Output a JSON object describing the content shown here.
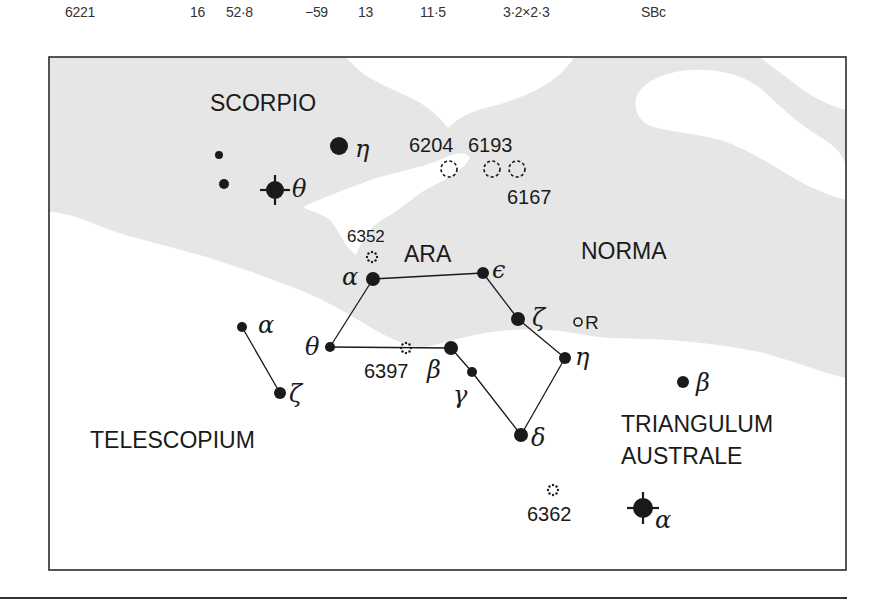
{
  "table_row": {
    "ngc": "6221",
    "ra_h": "16",
    "ra_m": "52·8",
    "dec_d": "−59",
    "dec_m": "13",
    "magnitude": "11·5",
    "size": "3·2×2·3",
    "type": "SBc"
  },
  "map": {
    "constellations": [
      {
        "name": "SCORPIO",
        "x": 210,
        "y": 111,
        "size": 23
      },
      {
        "name": "ARA",
        "x": 404,
        "y": 262,
        "size": 23
      },
      {
        "name": "NORMA",
        "x": 581,
        "y": 259,
        "size": 23
      },
      {
        "name": "TELESCOPIUM",
        "x": 90,
        "y": 448,
        "size": 23
      },
      {
        "name": "TRIANGULUM",
        "x": 621,
        "y": 432,
        "size": 23
      },
      {
        "name": "AUSTRALE",
        "x": 621,
        "y": 464,
        "size": 23
      }
    ],
    "stars": [
      {
        "id": "sco-eta",
        "greek": "η",
        "x": 339,
        "y": 146,
        "r": 9,
        "lx": 355,
        "ly": 157
      },
      {
        "id": "sco-theta",
        "greek": "θ",
        "x": 275,
        "y": 190,
        "r": 9,
        "cross": true,
        "lx": 292,
        "ly": 197
      },
      {
        "id": "sco-a",
        "greek": "",
        "x": 219,
        "y": 155,
        "r": 4
      },
      {
        "id": "sco-b",
        "greek": "",
        "x": 224,
        "y": 184,
        "r": 5
      },
      {
        "id": "ara-alpha",
        "greek": "α",
        "x": 373,
        "y": 279,
        "r": 7,
        "lx": 342,
        "ly": 285
      },
      {
        "id": "ara-epsilon",
        "greek": "ϵ",
        "x": 483,
        "y": 273,
        "r": 6,
        "lx": 492,
        "ly": 278
      },
      {
        "id": "ara-zeta",
        "greek": "ζ",
        "x": 518,
        "y": 319,
        "r": 7,
        "lx": 532,
        "ly": 326
      },
      {
        "id": "ara-eta",
        "greek": "η",
        "x": 565,
        "y": 358,
        "r": 6,
        "lx": 575,
        "ly": 365
      },
      {
        "id": "ara-delta",
        "greek": "δ",
        "x": 521,
        "y": 435,
        "r": 7,
        "lx": 531,
        "ly": 446
      },
      {
        "id": "ara-gamma",
        "greek": "γ",
        "x": 472,
        "y": 372,
        "r": 5,
        "lx": 453,
        "ly": 403
      },
      {
        "id": "ara-beta",
        "greek": "β",
        "x": 451,
        "y": 348,
        "r": 7,
        "lx": 427,
        "ly": 378
      },
      {
        "id": "ara-theta",
        "greek": "θ",
        "x": 330,
        "y": 347,
        "r": 5,
        "lx": 305,
        "ly": 355
      },
      {
        "id": "tel-alpha",
        "greek": "α",
        "x": 242,
        "y": 327,
        "r": 5,
        "lx": 258,
        "ly": 333
      },
      {
        "id": "tel-zeta",
        "greek": "ζ",
        "x": 280,
        "y": 393,
        "r": 6,
        "lx": 289,
        "ly": 402
      },
      {
        "id": "tra-beta",
        "greek": "β",
        "x": 683,
        "y": 382,
        "r": 6,
        "lx": 696,
        "ly": 391
      },
      {
        "id": "tra-alpha",
        "greek": "α",
        "x": 643,
        "y": 508,
        "r": 10,
        "cross": true,
        "lx": 655,
        "ly": 528
      }
    ],
    "lines": [
      [
        "ara-alpha",
        "ara-epsilon"
      ],
      [
        "ara-epsilon",
        "ara-zeta"
      ],
      [
        "ara-zeta",
        "ara-eta"
      ],
      [
        "ara-eta",
        "ara-delta"
      ],
      [
        "ara-delta",
        "ara-gamma"
      ],
      [
        "ara-gamma",
        "ara-beta"
      ],
      [
        "ara-beta",
        "ara-theta"
      ],
      [
        "ara-theta",
        "ara-alpha"
      ],
      [
        "tel-alpha",
        "tel-zeta"
      ]
    ],
    "galaxies": [
      {
        "ngc": "6204",
        "x": 449,
        "y": 169,
        "lx": 409,
        "ly": 152
      },
      {
        "ngc": "6193",
        "x": 492,
        "y": 169,
        "lx": 468,
        "ly": 152
      },
      {
        "ngc": "6167",
        "x": 517,
        "y": 169,
        "lx": 507,
        "ly": 204
      }
    ],
    "clusters": [
      {
        "ngc": "6352",
        "x": 372,
        "y": 257,
        "lx": 347,
        "ly": 242,
        "label_size": 17
      },
      {
        "ngc": "6397",
        "x": 406,
        "y": 348,
        "lx": 364,
        "ly": 378,
        "label_size": 20
      },
      {
        "ngc": "6362",
        "x": 553,
        "y": 490,
        "lx": 527,
        "ly": 521,
        "label_size": 20
      }
    ],
    "variable": {
      "label": "R",
      "x": 578,
      "y": 322
    }
  },
  "colors": {
    "milky_way": "#e6e6e6",
    "ink": "#1a1a1a",
    "frame": "#2b2b2b"
  }
}
